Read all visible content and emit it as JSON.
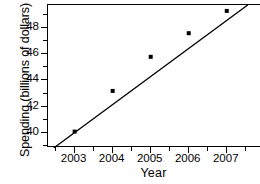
{
  "chart_data": {
    "type": "scatter",
    "title": "",
    "xlabel": "Year",
    "ylabel": "Spending (billions of dollars)",
    "x": [
      2003,
      2004,
      2005,
      2006,
      2007
    ],
    "values": [
      40.1,
      43.2,
      45.8,
      47.6,
      49.3
    ],
    "categories": [
      "2003",
      "2004",
      "2005",
      "2006",
      "2007"
    ],
    "xtick_labels": [
      "2003",
      "2004",
      "2005",
      "2006",
      "2007"
    ],
    "ytick_labels": [
      "40",
      "42",
      "44",
      "46",
      "48"
    ],
    "ytick_values": [
      40,
      42,
      44,
      46,
      48
    ],
    "yminor_values": [
      39,
      41,
      43,
      45,
      47,
      49
    ],
    "xlim": [
      2002.3,
      2007.9
    ],
    "ylim": [
      38.85,
      49.75
    ],
    "grid": false,
    "legend": null,
    "trendline": {
      "name": "least-squares regression line",
      "x_start": 2002.45,
      "y_start": 38.85,
      "x_end": 2007.55,
      "y_end": 49.75
    },
    "marker": "square",
    "series": [
      {
        "name": "Spending",
        "values": [
          40.1,
          43.2,
          45.8,
          47.6,
          49.3
        ]
      }
    ]
  }
}
